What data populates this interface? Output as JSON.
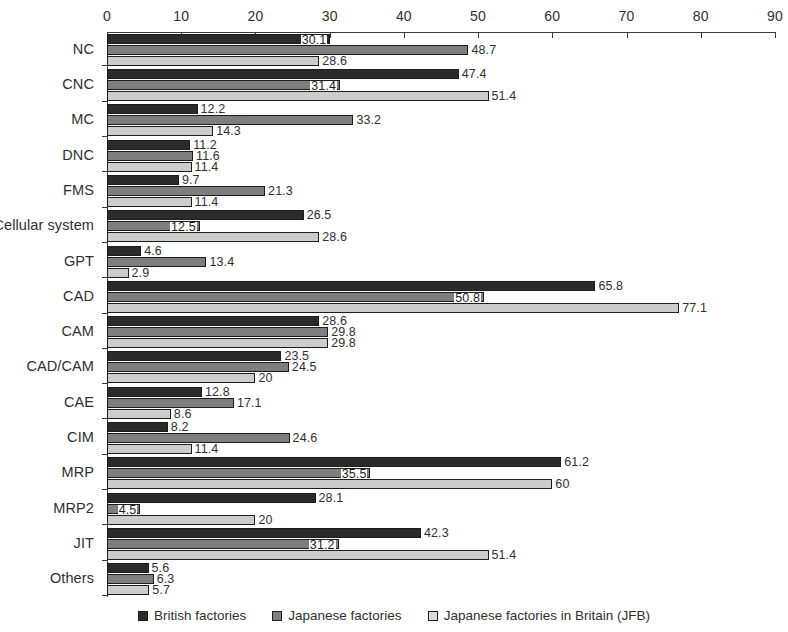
{
  "chart_data": {
    "type": "bar",
    "orientation": "horizontal",
    "title": "",
    "subtitle": "",
    "xlabel": "",
    "ylabel": "",
    "xlim": [
      0,
      90
    ],
    "xticks": [
      0,
      10,
      20,
      30,
      40,
      50,
      60,
      70,
      80,
      90
    ],
    "tick_labels": [
      "0",
      "10",
      "20",
      "30",
      "40",
      "50",
      "60",
      "70",
      "80",
      "90"
    ],
    "grid": false,
    "axis_position": "top",
    "legend_position": "bottom",
    "categories": [
      "NC",
      "CNC",
      "MC",
      "DNC",
      "FMS",
      "Cellular system",
      "GPT",
      "CAD",
      "CAM",
      "CAD/CAM",
      "CAE",
      "CIM",
      "MRP",
      "MRP2",
      "JIT",
      "Others"
    ],
    "series": [
      {
        "name": "British factories",
        "color": "#2b2b2b",
        "values": [
          30.1,
          47.4,
          12.2,
          11.2,
          9.7,
          26.5,
          4.6,
          65.8,
          28.6,
          23.5,
          12.8,
          8.2,
          61.2,
          28.1,
          42.3,
          5.6
        ],
        "labels": [
          "30.1",
          "47.4",
          "12.2",
          "11.2",
          "9.7",
          "26.5",
          "4.6",
          "65.8",
          "28.6",
          "23.5",
          "12.8",
          "8.2",
          "61.2",
          "28.1",
          "42.3",
          "5.6"
        ],
        "label_placement": [
          "inside",
          "outside",
          "outside",
          "outside",
          "outside",
          "outside",
          "outside",
          "outside",
          "outside",
          "outside",
          "outside",
          "outside",
          "outside",
          "outside",
          "outside",
          "outside"
        ]
      },
      {
        "name": "Japanese factories",
        "color": "#7e7e7e",
        "values": [
          48.7,
          31.4,
          33.2,
          11.6,
          21.3,
          12.5,
          13.4,
          50.8,
          29.8,
          24.5,
          17.1,
          24.6,
          35.5,
          4.5,
          31.2,
          6.3
        ],
        "labels": [
          "48.7",
          "31.4",
          "33.2",
          "11.6",
          "21.3",
          "12.5",
          "13.4",
          "50.8",
          "29.8",
          "24.5",
          "17.1",
          "24.6",
          "35.5",
          "4.5",
          "31.2",
          "6.3"
        ],
        "label_placement": [
          "outside",
          "inside",
          "outside",
          "outside",
          "outside",
          "inside",
          "outside",
          "inside",
          "outside",
          "outside",
          "outside",
          "outside",
          "inside",
          "inside",
          "inside",
          "outside"
        ]
      },
      {
        "name": "Japanese factories in Britain (JFB)",
        "color": "#cccccc",
        "values": [
          28.6,
          51.4,
          14.3,
          11.4,
          11.4,
          28.6,
          2.9,
          77.1,
          29.8,
          20,
          8.6,
          11.4,
          60,
          20,
          51.4,
          5.7
        ],
        "labels": [
          "28.6",
          "51.4",
          "14.3",
          "11.4",
          "11.4",
          "28.6",
          "2.9",
          "77.1",
          "29.8",
          "20",
          "8.6",
          "11.4",
          "60",
          "20",
          "51.4",
          "5.7"
        ],
        "label_placement": [
          "outside",
          "outside",
          "outside",
          "outside",
          "outside",
          "outside",
          "outside",
          "outside",
          "outside",
          "outside",
          "outside",
          "outside",
          "outside",
          "outside",
          "outside",
          "outside"
        ]
      }
    ]
  }
}
